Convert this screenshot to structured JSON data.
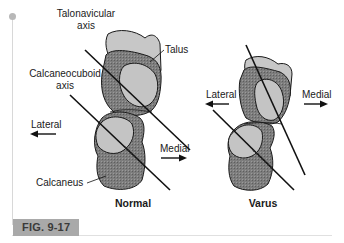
{
  "figure": {
    "caption_label": "FIG. 9-17",
    "panels": [
      {
        "title": "Normal",
        "labels": {
          "talonavicular_line1": "Talonavicular",
          "talonavicular_line2": "axis",
          "calcaneocuboid_line1": "Calcaneocuboid",
          "calcaneocuboid_line2": "axis",
          "talus": "Talus",
          "calcaneus": "Calcaneus",
          "lateral": "Lateral",
          "medial": "Medial"
        }
      },
      {
        "title": "Varus",
        "labels": {
          "lateral": "Lateral",
          "medial": "Medial"
        }
      }
    ],
    "colors": {
      "bone_dark": "#7a7a7a",
      "bone_light": "#c4c4c4",
      "outline": "#1a1a1a",
      "caption_bg": "#a9a9a9"
    }
  }
}
